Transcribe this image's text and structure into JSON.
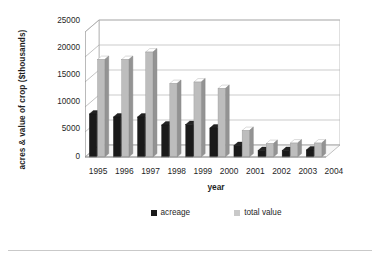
{
  "chart_data": {
    "type": "bar",
    "title": "",
    "xlabel": "year",
    "ylabel": "acres & value of crop ($thousands)",
    "categories": [
      "1995",
      "1996",
      "1997",
      "1998",
      "1999",
      "2000",
      "2001",
      "2002",
      "2003",
      "2004"
    ],
    "series": [
      {
        "name": "acreage",
        "color": "#1a1a1a",
        "values": [
          8600,
          8000,
          8000,
          6400,
          6500,
          5800,
          2300,
          1300,
          1300,
          1400
        ]
      },
      {
        "name": "total value",
        "color": "#bdbdbd",
        "values": [
          19500,
          19500,
          21000,
          14700,
          15000,
          13700,
          5300,
          2700,
          2800,
          2800
        ]
      }
    ],
    "ylim": [
      0,
      25000
    ],
    "yticks": [
      "0",
      "5000",
      "10000",
      "15000",
      "20000",
      "25000"
    ],
    "ytick_values": [
      0,
      5000,
      10000,
      15000,
      20000,
      25000
    ],
    "grid": true,
    "legend_position": "bottom",
    "style": "3d-perspective-column"
  },
  "footer": {
    "caption": ""
  },
  "colors": {
    "acreage": "#1a1a1a",
    "total_value": "#bdbdbd",
    "grid": "#b0b0b0",
    "axis": "#8c8c8c",
    "floor": "#f2f2f2",
    "background": "#ffffff"
  }
}
